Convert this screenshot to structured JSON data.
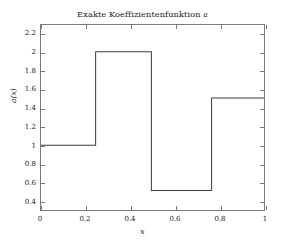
{
  "chart_data": {
    "type": "line",
    "title": "Exakte Koeffizientenfunktion a",
    "title_plain": "Exakte Koeffizientenfunktion",
    "title_symbol": "a",
    "xlabel": "x",
    "ylabel": "a(x)",
    "xlim": [
      0,
      1
    ],
    "ylim": [
      0.3,
      2.3
    ],
    "grid": false,
    "legend": null,
    "xticks": [
      0,
      0.2,
      0.4,
      0.6,
      0.8,
      1
    ],
    "xtick_labels": [
      "0",
      "0.2",
      "0.4",
      "0.6",
      "0.8",
      "1"
    ],
    "yticks": [
      0.4,
      0.6,
      0.8,
      1,
      1.2,
      1.4,
      1.6,
      1.8,
      2,
      2.2
    ],
    "ytick_labels": [
      "0.4",
      "0.6",
      "0.8",
      "1",
      "1.2",
      "1.4",
      "1.6",
      "1.8",
      "2",
      "2.2"
    ],
    "line_color": "#3a3a3a",
    "line_width": 1,
    "piecewise_segments": [
      {
        "x_start": 0.0,
        "x_end": 0.245,
        "value": 1.0
      },
      {
        "x_start": 0.245,
        "x_end": 0.495,
        "value": 2.01
      },
      {
        "x_start": 0.495,
        "x_end": 0.765,
        "value": 0.51
      },
      {
        "x_start": 0.765,
        "x_end": 1.0,
        "value": 1.51
      }
    ],
    "x": [
      0,
      0.245,
      0.245,
      0.495,
      0.495,
      0.765,
      0.765,
      1
    ],
    "y": [
      1.0,
      1.0,
      2.01,
      2.01,
      0.51,
      0.51,
      1.51,
      1.51
    ]
  },
  "figure": {
    "background_color": "#ffffff",
    "axes_border_color": "#7a7a7a"
  }
}
